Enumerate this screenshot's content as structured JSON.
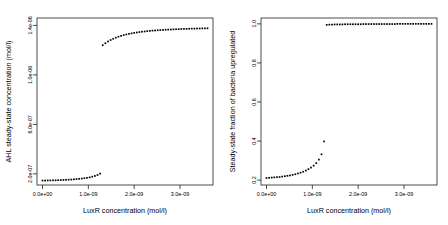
{
  "figure": {
    "background": "#ffffff",
    "point_color": "#000000",
    "axis_color": "#000000"
  },
  "chart_data": [
    {
      "type": "scatter",
      "panel": "left",
      "title": "",
      "xlabel": "LuxR concentration (mol/l)",
      "ylabel": "AHL steady-state concentration (mol/l)",
      "xlim": [
        -1.2e-10,
        3.72e-09
      ],
      "ylim": [
        1.1e-07,
        1.46e-06
      ],
      "xticks": [
        0.0,
        1e-09,
        2e-09,
        3e-09
      ],
      "xticklabels": [
        "0.0e+00",
        "1.0e-09",
        "2.0e-09",
        "3.0e-09"
      ],
      "yticks": [
        2e-07,
        6e-07,
        1e-06,
        1.4e-06
      ],
      "yticklabels": [
        "2.0e-07",
        "6.0e-07",
        "1.0e-06",
        "1.4e-06"
      ],
      "grid": false,
      "legend": null,
      "marker": "square",
      "x": [
        0.0,
        5.7e-11,
        1.14e-10,
        1.71e-10,
        2.29e-10,
        2.86e-10,
        3.43e-10,
        4e-10,
        4.57e-10,
        5.14e-10,
        5.71e-10,
        6.29e-10,
        6.86e-10,
        7.43e-10,
        8e-10,
        8.57e-10,
        9.14e-10,
        9.71e-10,
        1.029e-09,
        1.086e-09,
        1.143e-09,
        1.2e-09,
        1.257e-09,
        1.314e-09,
        1.371e-09,
        1.429e-09,
        1.486e-09,
        1.543e-09,
        1.6e-09,
        1.657e-09,
        1.714e-09,
        1.771e-09,
        1.829e-09,
        1.886e-09,
        1.943e-09,
        2e-09,
        2.057e-09,
        2.114e-09,
        2.171e-09,
        2.229e-09,
        2.286e-09,
        2.343e-09,
        2.4e-09,
        2.457e-09,
        2.514e-09,
        2.571e-09,
        2.629e-09,
        2.686e-09,
        2.743e-09,
        2.8e-09,
        2.857e-09,
        2.914e-09,
        2.971e-09,
        3.029e-09,
        3.086e-09,
        3.143e-09,
        3.2e-09,
        3.257e-09,
        3.314e-09,
        3.371e-09,
        3.429e-09,
        3.486e-09,
        3.543e-09,
        3.6e-09
      ],
      "y": [
        1.46e-07,
        1.46e-07,
        1.47e-07,
        1.47e-07,
        1.48e-07,
        1.48e-07,
        1.49e-07,
        1.5e-07,
        1.51e-07,
        1.52e-07,
        1.53e-07,
        1.54e-07,
        1.56e-07,
        1.58e-07,
        1.6e-07,
        1.62e-07,
        1.65e-07,
        1.68e-07,
        1.72e-07,
        1.77e-07,
        1.83e-07,
        1.91e-07,
        2.02e-07,
        1.24e-06,
        1.256e-06,
        1.27e-06,
        1.282e-06,
        1.292e-06,
        1.301e-06,
        1.309e-06,
        1.316e-06,
        1.322e-06,
        1.327e-06,
        1.332e-06,
        1.336e-06,
        1.34e-06,
        1.343e-06,
        1.346e-06,
        1.349e-06,
        1.351e-06,
        1.354e-06,
        1.356e-06,
        1.358e-06,
        1.359e-06,
        1.361e-06,
        1.362e-06,
        1.364e-06,
        1.365e-06,
        1.366e-06,
        1.367e-06,
        1.368e-06,
        1.369e-06,
        1.37e-06,
        1.371e-06,
        1.372e-06,
        1.372e-06,
        1.373e-06,
        1.374e-06,
        1.374e-06,
        1.375e-06,
        1.375e-06,
        1.376e-06,
        1.376e-06,
        1.377e-06
      ]
    },
    {
      "type": "scatter",
      "panel": "right",
      "title": "",
      "xlabel": "LuxR concentration (mol/l)",
      "ylabel": "Steady-state fraction of bacteria upregulated",
      "xlim": [
        -1.2e-10,
        3.72e-09
      ],
      "ylim": [
        0.175,
        1.03
      ],
      "xticks": [
        0.0,
        1e-09,
        2e-09,
        3e-09
      ],
      "xticklabels": [
        "0.0e+00",
        "1.0e-09",
        "2.0e-09",
        "3.0e-09"
      ],
      "yticks": [
        0.2,
        0.4,
        0.6,
        0.8,
        1.0
      ],
      "yticklabels": [
        "0.2",
        "0.4",
        "0.6",
        "0.8",
        "1.0"
      ],
      "grid": false,
      "legend": null,
      "marker": "square",
      "x": [
        0.0,
        5.7e-11,
        1.14e-10,
        1.71e-10,
        2.29e-10,
        2.86e-10,
        3.43e-10,
        4e-10,
        4.57e-10,
        5.14e-10,
        5.71e-10,
        6.29e-10,
        6.86e-10,
        7.43e-10,
        8e-10,
        8.57e-10,
        9.14e-10,
        9.71e-10,
        1.029e-09,
        1.086e-09,
        1.143e-09,
        1.2e-09,
        1.257e-09,
        1.314e-09,
        1.371e-09,
        1.429e-09,
        1.486e-09,
        1.543e-09,
        1.6e-09,
        1.657e-09,
        1.714e-09,
        1.771e-09,
        1.829e-09,
        1.886e-09,
        1.943e-09,
        2e-09,
        2.057e-09,
        2.114e-09,
        2.171e-09,
        2.229e-09,
        2.286e-09,
        2.343e-09,
        2.4e-09,
        2.457e-09,
        2.514e-09,
        2.571e-09,
        2.629e-09,
        2.686e-09,
        2.743e-09,
        2.8e-09,
        2.857e-09,
        2.914e-09,
        2.971e-09,
        3.029e-09,
        3.086e-09,
        3.143e-09,
        3.2e-09,
        3.257e-09,
        3.314e-09,
        3.371e-09,
        3.429e-09,
        3.486e-09,
        3.543e-09,
        3.6e-09
      ],
      "y": [
        0.211,
        0.212,
        0.213,
        0.214,
        0.215,
        0.216,
        0.218,
        0.22,
        0.222,
        0.224,
        0.227,
        0.23,
        0.234,
        0.238,
        0.243,
        0.249,
        0.256,
        0.264,
        0.274,
        0.287,
        0.305,
        0.332,
        0.398,
        0.995,
        0.996,
        0.996,
        0.997,
        0.997,
        0.997,
        0.997,
        0.998,
        0.998,
        0.998,
        0.998,
        0.998,
        0.998,
        0.998,
        0.999,
        0.999,
        0.999,
        0.999,
        0.999,
        0.999,
        0.999,
        0.999,
        0.999,
        0.999,
        0.999,
        0.999,
        0.999,
        1.0,
        1.0,
        1.0,
        1.0,
        1.0,
        1.0,
        1.0,
        1.0,
        1.0,
        1.0,
        1.0,
        1.0,
        1.0,
        1.0
      ]
    }
  ]
}
